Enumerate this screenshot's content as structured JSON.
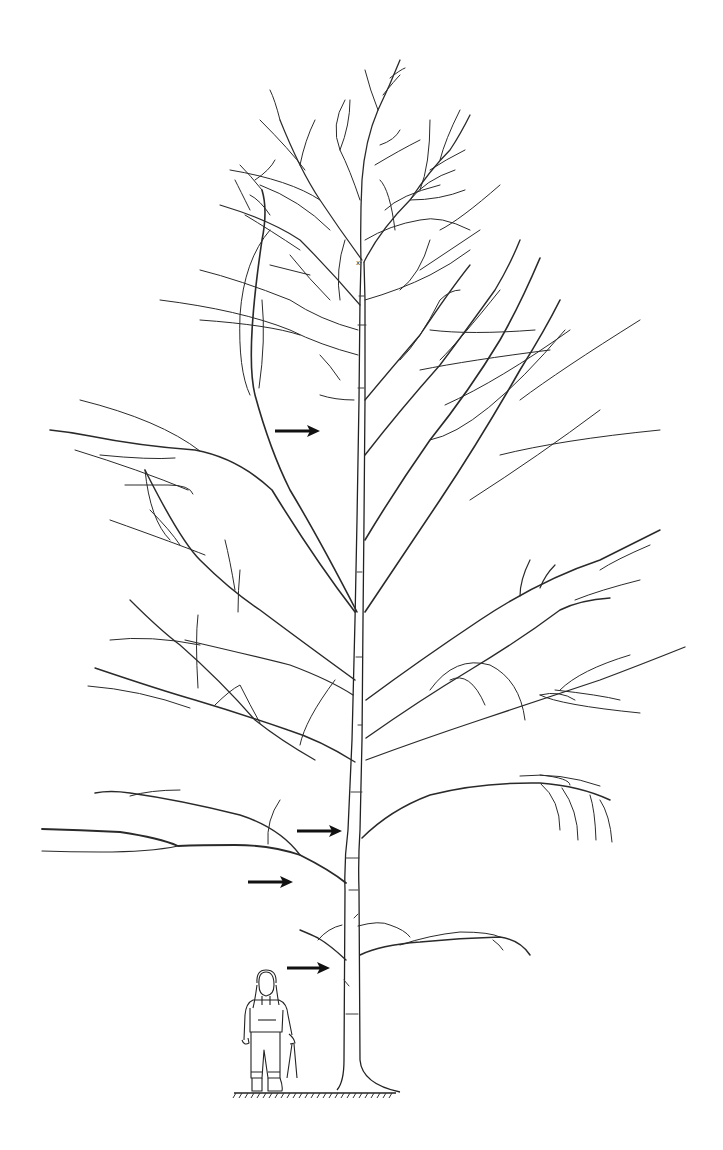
{
  "figure": {
    "type": "tree-line-drawing",
    "background": "#ffffff",
    "line_color": "#2a2a2a",
    "arrow_color": "#111111"
  },
  "arrows": [
    {
      "id": "arrow-upper-crown",
      "x1": 275,
      "x2": 320,
      "y": 431
    },
    {
      "id": "arrow-lower-crown",
      "x1": 297,
      "x2": 342,
      "y": 831
    },
    {
      "id": "arrow-first-scaffold",
      "x1": 248,
      "x2": 293,
      "y": 882
    },
    {
      "id": "arrow-lowest-limb",
      "x1": 287,
      "x2": 330,
      "y": 968
    }
  ],
  "ground": {
    "x1": 234,
    "x2": 396,
    "y": 1093
  },
  "scale_figure": {
    "label": "person-with-pruning-shears",
    "x": 268,
    "base_y": 1092
  }
}
